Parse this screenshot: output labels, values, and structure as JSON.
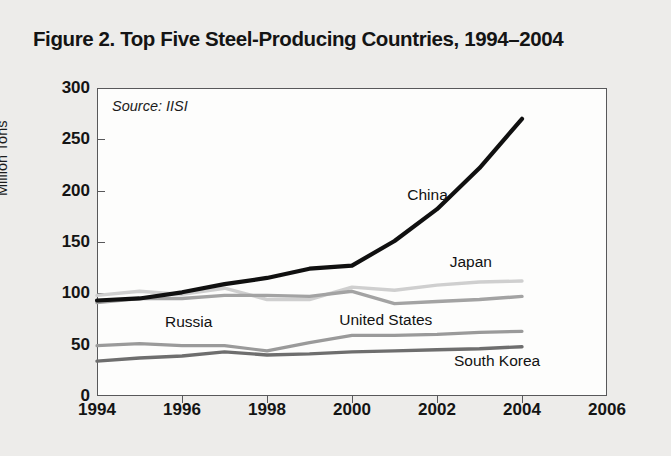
{
  "figure": {
    "title": "Figure 2. Top Five Steel-Producing Countries, 1994–2004",
    "source_note": "Source: IISI"
  },
  "chart_data": {
    "type": "line",
    "title": "Figure 2. Top Five Steel-Producing Countries, 1994–2004",
    "xlabel": "",
    "ylabel": "Million Tons",
    "xlim": [
      1994,
      2006
    ],
    "ylim": [
      0,
      300
    ],
    "xticks": [
      1994,
      1996,
      1998,
      2000,
      2002,
      2004,
      2006
    ],
    "yticks": [
      0,
      50,
      100,
      150,
      200,
      250,
      300
    ],
    "xtick_labels": [
      "1994",
      "1996",
      "1998",
      "2000",
      "2002",
      "2004",
      "2006"
    ],
    "ytick_labels": [
      "0",
      "50",
      "100",
      "150",
      "200",
      "250",
      "300"
    ],
    "grid": false,
    "legend": "inline-labels",
    "source": "IISI",
    "x": [
      1994,
      1995,
      1996,
      1997,
      1998,
      1999,
      2000,
      2001,
      2002,
      2003,
      2004
    ],
    "series": [
      {
        "name": "China",
        "color": "#101010",
        "width": 4.2,
        "values": [
          93,
          95,
          101,
          109,
          115,
          124,
          127,
          151,
          182,
          222,
          270
        ],
        "label": {
          "text": "China",
          "x": 2001.3,
          "y": 196
        }
      },
      {
        "name": "Japan",
        "color": "#cfcfcf",
        "width": 3.4,
        "values": [
          98,
          102,
          99,
          105,
          94,
          94,
          106,
          103,
          108,
          111,
          112
        ],
        "label": {
          "text": "Japan",
          "x": 2002.3,
          "y": 131
        }
      },
      {
        "name": "United States",
        "color": "#a3a3a3",
        "width": 3.4,
        "values": [
          91,
          95,
          95,
          98,
          98,
          97,
          102,
          90,
          92,
          94,
          97
        ],
        "label": {
          "text": "United States",
          "x": 1999.7,
          "y": 74
        }
      },
      {
        "name": "Russia",
        "color": "#9a9a9a",
        "width": 3.2,
        "values": [
          49,
          51,
          49,
          49,
          44,
          52,
          59,
          59,
          60,
          62,
          63
        ],
        "label": {
          "text": "Russia",
          "x": 1995.6,
          "y": 72
        }
      },
      {
        "name": "South Korea",
        "color": "#6e6e6e",
        "width": 3.4,
        "values": [
          34,
          37,
          39,
          43,
          40,
          41,
          43,
          44,
          45,
          46,
          48
        ],
        "label": {
          "text": "South Korea",
          "x": 2002.4,
          "y": 34
        }
      }
    ]
  },
  "axis": {
    "y_title": "Million Tons"
  }
}
